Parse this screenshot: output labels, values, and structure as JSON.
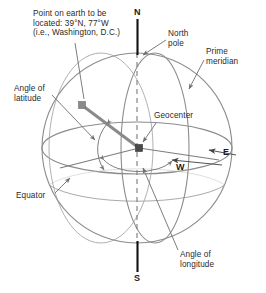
{
  "figure": {
    "type": "geographic-coordinate-sphere-diagram",
    "background_color": "#ffffff",
    "line_color": "#8c8c8c",
    "axis_color": "#111111",
    "text_color": "#2a2a2a",
    "marker_color": "#808080"
  },
  "labels": {
    "point_on_earth": "Point on earth to be\nlocated: 39°N, 77°W\n(i.e., Washington, D.C.)",
    "north_pole": "North\npole",
    "prime_meridian": "Prime\nmeridian",
    "angle_of_latitude": "Angle of\nlatitude",
    "geocenter": "Geocenter",
    "equator": "Equator",
    "angle_of_longitude": "Angle of\nlongitude",
    "north_axis": "N",
    "south_axis": "S",
    "east": "E",
    "west": "W"
  },
  "values": {
    "latitude": "39°N",
    "longitude": "77°W",
    "place": "Washington, D.C."
  },
  "geometry": {
    "sphere_center_x": 137,
    "sphere_center_y": 148,
    "sphere_radius": 95,
    "equator_ry": 26,
    "meridian_rx": 34,
    "point_marker_x": 82,
    "point_marker_y": 105,
    "geocenter_marker_x": 139,
    "geocenter_marker_y": 148
  }
}
